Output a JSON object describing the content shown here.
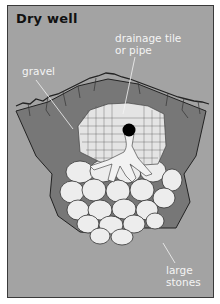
{
  "figure": {
    "title": "Dry well",
    "labels": {
      "pipe_line1": "drainage tile",
      "pipe_line2": "or pipe",
      "gravel": "gravel",
      "stones_line1": "large",
      "stones_line2": "stones"
    }
  },
  "colors": {
    "background": "#a3a3a3",
    "pit": "#777777",
    "soil_line": "#222222",
    "stone": "#ededed",
    "pipe": "#000000",
    "label_text": "#f4f4f4",
    "title_text": "#111111"
  }
}
